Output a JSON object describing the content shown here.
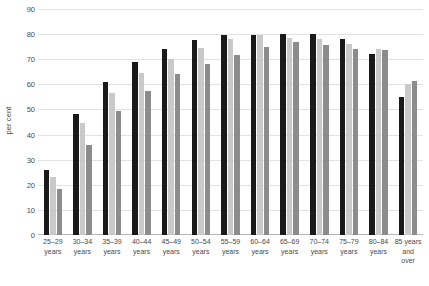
{
  "chart_data": {
    "type": "bar",
    "title": "",
    "xlabel": "",
    "ylabel": "per cent",
    "ylim": [
      0,
      90
    ],
    "ytick_step": 10,
    "yticks": [
      90,
      80,
      70,
      60,
      50,
      40,
      30,
      20,
      10,
      0
    ],
    "grid": true,
    "legend": "none",
    "categories": [
      "25–29\nyears",
      "30–34\nyears",
      "35–39\nyears",
      "40–44\nyears",
      "45–49\nyears",
      "50–54\nyears",
      "55–59\nyears",
      "60–64\nyears",
      "65–69\nyears",
      "70–74\nyears",
      "75–79\nyears",
      "80–84\nyears",
      "85 years\nand\nover"
    ],
    "series": [
      {
        "name": "series-1",
        "color": "#1a1a1a",
        "values": [
          26,
          48,
          61,
          69,
          74,
          77.5,
          79.5,
          79.5,
          80,
          80,
          78,
          72,
          55
        ]
      },
      {
        "name": "series-2",
        "color": "#c9c9c9",
        "values": [
          23,
          44.5,
          56.5,
          64.5,
          70,
          74.5,
          78,
          79.5,
          78.5,
          78,
          76,
          74,
          60
        ]
      },
      {
        "name": "series-3",
        "color": "#8c8c8c",
        "values": [
          18.5,
          36,
          49.5,
          57.5,
          64,
          68,
          71.5,
          75,
          77,
          75.5,
          74,
          73.5,
          61.5
        ]
      }
    ],
    "colors": {
      "gridline": "#e2e2e2",
      "axis": "#b8b8b8",
      "text": "#4a4a4a",
      "background": "#ffffff"
    }
  }
}
